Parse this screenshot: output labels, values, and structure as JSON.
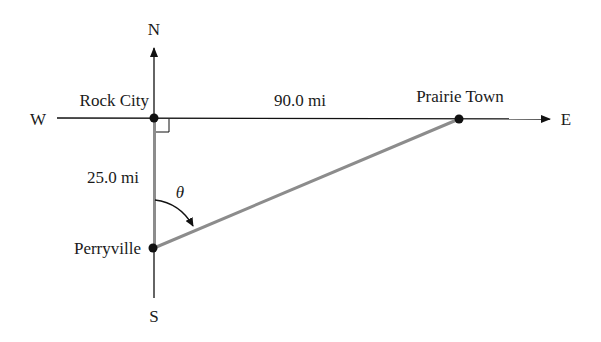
{
  "diagram": {
    "compass": {
      "north": "N",
      "south": "S",
      "east": "E",
      "west": "W"
    },
    "places": [
      {
        "name": "Rock City"
      },
      {
        "name": "Prairie Town"
      },
      {
        "name": "Perryville"
      }
    ],
    "distances": {
      "rock_city_to_prairie_town": "90.0 mi",
      "rock_city_to_perryville": "25.0 mi"
    },
    "angle_label": "θ",
    "colors": {
      "axis": "#111111",
      "path": "#8c8c8c",
      "dot": "#111111"
    }
  }
}
